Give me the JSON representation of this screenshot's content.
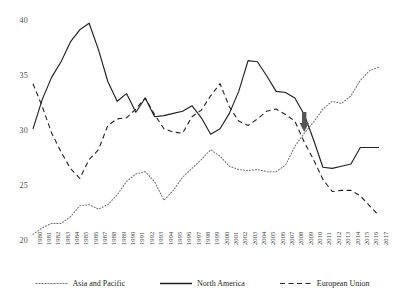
{
  "chart_data": {
    "type": "line",
    "title": "",
    "xlabel": "",
    "ylabel": "",
    "ylim": [
      20,
      40
    ],
    "yticks": [
      20,
      25,
      30,
      35,
      40
    ],
    "grid": false,
    "legend_position": "bottom",
    "x": [
      1980,
      1981,
      1982,
      1983,
      1984,
      1985,
      1986,
      1987,
      1988,
      1989,
      1990,
      1991,
      1992,
      1993,
      1994,
      1995,
      1996,
      1997,
      1998,
      1999,
      2000,
      2001,
      2002,
      2003,
      2004,
      2005,
      2006,
      2007,
      2008,
      2009,
      2010,
      2011,
      2012,
      2013,
      2014,
      2015,
      2016,
      2017
    ],
    "categories": [
      "1980",
      "1981",
      "1982",
      "1983",
      "1984",
      "1985",
      "1986",
      "1987",
      "1988",
      "1989",
      "1990",
      "1991",
      "1992",
      "1993",
      "1994",
      "1995",
      "1996",
      "1997",
      "1998",
      "1999",
      "2000",
      "2001",
      "2002",
      "2003",
      "2004",
      "2005",
      "2006",
      "2007",
      "2008",
      "2009",
      "2010",
      "2011",
      "2012",
      "2013",
      "2014",
      "2015",
      "2016",
      "2017"
    ],
    "series": [
      {
        "name": "Asia and Pacific",
        "style": "dotted",
        "color": "#6b6b6b",
        "values": [
          20.6,
          21.2,
          21.6,
          21.6,
          22.2,
          23.2,
          23.3,
          22.9,
          23.3,
          24.2,
          25.4,
          26.1,
          26.3,
          25.4,
          23.7,
          24.6,
          25.8,
          26.6,
          27.4,
          28.3,
          27.7,
          26.8,
          26.5,
          26.4,
          26.5,
          26.3,
          26.3,
          26.9,
          28.6,
          29.8,
          30.8,
          32.0,
          32.7,
          32.5,
          33.2,
          34.6,
          35.5,
          35.8
        ]
      },
      {
        "name": "North America",
        "style": "solid",
        "color": "#231f20",
        "values": [
          30.2,
          32.9,
          34.9,
          36.3,
          38.1,
          39.2,
          39.8,
          37.4,
          34.5,
          32.7,
          33.4,
          31.7,
          33.0,
          31.3,
          31.4,
          31.6,
          31.8,
          32.3,
          31.2,
          29.7,
          30.2,
          31.6,
          33.6,
          36.4,
          36.3,
          35.0,
          33.6,
          33.5,
          33.0,
          31.5,
          29.2,
          26.7,
          26.6,
          26.8,
          27.0,
          28.5,
          28.5,
          28.5
        ]
      },
      {
        "name": "European Union",
        "style": "dashed",
        "color": "#231f20",
        "values": [
          34.3,
          32.2,
          29.8,
          28.1,
          26.6,
          25.7,
          27.4,
          28.3,
          30.5,
          31.1,
          31.2,
          32.0,
          33.0,
          31.5,
          30.2,
          29.9,
          29.8,
          31.3,
          31.9,
          33.2,
          34.3,
          32.2,
          30.9,
          30.5,
          31.1,
          31.8,
          32.0,
          31.5,
          30.9,
          29.0,
          27.4,
          25.6,
          24.5,
          24.6,
          24.6,
          24.1,
          23.2,
          22.3
        ]
      }
    ],
    "annotations": [
      {
        "type": "arrow",
        "name": "crisis-arrow",
        "x_year": 2009,
        "direction": "down",
        "color": "#565656"
      }
    ]
  },
  "legend": {
    "items": [
      {
        "label": "Asia and Pacific",
        "key": "dotted-line-key"
      },
      {
        "label": "North America",
        "key": "solid-line-key"
      },
      {
        "label": "European Union",
        "key": "dashed-line-key"
      }
    ]
  }
}
